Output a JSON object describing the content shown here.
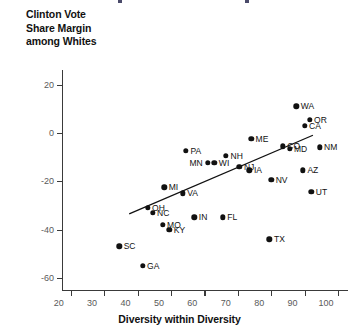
{
  "chart_data": {
    "type": "scatter",
    "title": "",
    "ylabel": "Clinton Vote\nShare Margin\namong Whites",
    "xlabel": "Diversity within Diversity",
    "xlim": [
      12,
      103
    ],
    "ylim": [
      -65,
      26
    ],
    "xticks": [
      20,
      30,
      40,
      50,
      60,
      70,
      80,
      90,
      100
    ],
    "yticks": [
      20,
      0,
      -20,
      -40,
      -60
    ],
    "grid": false,
    "legend": null,
    "point_color": "#111111",
    "trendline": {
      "x": [
        37.5,
        92.5
      ],
      "y": [
        -33.5,
        -1.0
      ],
      "color": "#111111"
    },
    "points": [
      {
        "label": "WA",
        "x": 87.5,
        "y": 11.0,
        "label_pos": "right"
      },
      {
        "label": "OR",
        "x": 91.5,
        "y": 5.5,
        "label_pos": "right"
      },
      {
        "label": "CA",
        "x": 90.0,
        "y": 3.0,
        "label_pos": "right"
      },
      {
        "label": "NM",
        "x": 94.5,
        "y": -6.0,
        "label_pos": "right"
      },
      {
        "label": "ME",
        "x": 74.0,
        "y": -2.5,
        "label_pos": "right"
      },
      {
        "label": "CO",
        "x": 83.5,
        "y": -5.5,
        "label_pos": "right"
      },
      {
        "label": "MD",
        "x": 85.5,
        "y": -6.5,
        "label_pos": "right"
      },
      {
        "label": "NH",
        "x": 66.5,
        "y": -9.5,
        "label_pos": "right"
      },
      {
        "label": "WI",
        "x": 63.0,
        "y": -12.5,
        "label_pos": "right"
      },
      {
        "label": "MN",
        "x": 61.0,
        "y": -12.5,
        "label_pos": "left"
      },
      {
        "label": "NJ",
        "x": 70.5,
        "y": -14.0,
        "label_pos": "right"
      },
      {
        "label": "IA",
        "x": 73.5,
        "y": -15.5,
        "label_pos": "right"
      },
      {
        "label": "AZ",
        "x": 89.5,
        "y": -15.5,
        "label_pos": "right"
      },
      {
        "label": "NV",
        "x": 80.0,
        "y": -19.5,
        "label_pos": "right"
      },
      {
        "label": "UT",
        "x": 92.0,
        "y": -24.5,
        "label_pos": "right"
      },
      {
        "label": "PA",
        "x": 54.5,
        "y": -7.5,
        "label_pos": "right"
      },
      {
        "label": "MI",
        "x": 48.0,
        "y": -22.5,
        "label_pos": "right"
      },
      {
        "label": "VA",
        "x": 53.5,
        "y": -25.0,
        "label_pos": "right"
      },
      {
        "label": "OH",
        "x": 43.0,
        "y": -31.0,
        "label_pos": "right"
      },
      {
        "label": "NC",
        "x": 44.5,
        "y": -33.0,
        "label_pos": "right"
      },
      {
        "label": "IN",
        "x": 57.0,
        "y": -35.0,
        "label_pos": "right"
      },
      {
        "label": "FL",
        "x": 65.5,
        "y": -35.0,
        "label_pos": "right"
      },
      {
        "label": "MO",
        "x": 47.5,
        "y": -38.0,
        "label_pos": "right"
      },
      {
        "label": "KY",
        "x": 49.5,
        "y": -40.0,
        "label_pos": "right"
      },
      {
        "label": "TX",
        "x": 79.5,
        "y": -44.0,
        "label_pos": "right"
      },
      {
        "label": "SC",
        "x": 34.5,
        "y": -47.0,
        "label_pos": "right"
      },
      {
        "label": "GA",
        "x": 41.5,
        "y": -55.0,
        "label_pos": "right"
      }
    ]
  }
}
